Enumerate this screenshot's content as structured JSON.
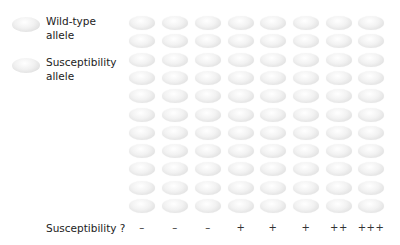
{
  "legend": {
    "items": [
      {
        "label_line1": "Wild-type",
        "label_line2": "allele",
        "icon": "wild-type-allele-ellipse",
        "color": "#e6e6e6"
      },
      {
        "label_line1": "Susceptibility",
        "label_line2": "allele",
        "icon": "susceptibility-allele-ellipse",
        "color": "#e6e6e6"
      }
    ]
  },
  "grid": {
    "rows": 11,
    "columns": 8,
    "cell_color": "#e6e6e6"
  },
  "footer": {
    "label": "Susceptibility ?",
    "scores": [
      "–",
      "–",
      "–",
      "+",
      "+",
      "+",
      "++",
      "+++"
    ]
  }
}
